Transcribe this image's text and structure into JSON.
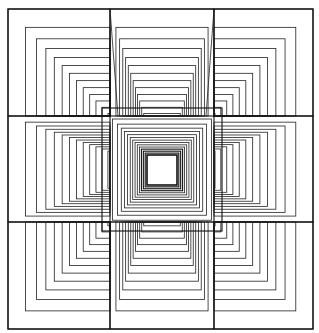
{
  "artwork": {
    "description": "Op-art line drawing of nested squares arranged in a 3x3 grid with a central frontal square",
    "stroke_color": "#222222",
    "background_color": "#ffffff",
    "canvas": {
      "width": 319,
      "height": 333
    },
    "outer_frame": {
      "x": 8,
      "y": 9,
      "w": 305,
      "h": 320
    },
    "columns_x": [
      8,
      110,
      214,
      313
    ],
    "rows_y": [
      9,
      116,
      222,
      329
    ],
    "center_square": {
      "x": 102,
      "y": 108,
      "w": 120,
      "h": 123
    },
    "center_hole": {
      "x": 147,
      "y": 155,
      "w": 30,
      "h": 30
    }
  }
}
